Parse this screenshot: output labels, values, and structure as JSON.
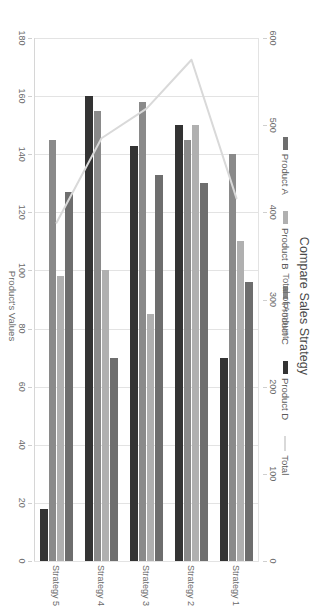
{
  "chart_data": {
    "type": "bar",
    "title": "Compare Sales Strategy",
    "categories": [
      "Strategy 1",
      "Strategy 2",
      "Strategy 3",
      "Strategy 4",
      "Strategy 5"
    ],
    "series": [
      {
        "name": "Product A",
        "values": [
          96,
          130,
          133,
          70,
          127
        ],
        "color": "#6e6e6e",
        "axis": "primary"
      },
      {
        "name": "Product B",
        "values": [
          110,
          150,
          85,
          100,
          98
        ],
        "color": "#b0b0b0",
        "axis": "primary"
      },
      {
        "name": "Product C",
        "values": [
          140,
          145,
          158,
          155,
          145
        ],
        "color": "#8a8a8a",
        "axis": "primary"
      },
      {
        "name": "Product D",
        "values": [
          70,
          150,
          143,
          160,
          18
        ],
        "color": "#333333",
        "axis": "primary"
      }
    ],
    "line_series": {
      "name": "Total",
      "values": [
        416,
        575,
        519,
        485,
        388
      ],
      "color": "#d9d9d9",
      "axis": "secondary"
    },
    "primary_axis": {
      "label": "Product's Values",
      "ticks": [
        0,
        20,
        40,
        60,
        80,
        100,
        120,
        140,
        160,
        180
      ],
      "min": 0,
      "max": 180,
      "position": "bottom"
    },
    "secondary_axis": {
      "label": "Total of Amount",
      "ticks": [
        0,
        100,
        200,
        300,
        400,
        500,
        600
      ],
      "min": 0,
      "max": 600,
      "position": "top"
    },
    "legend": {
      "position": "top",
      "entries": [
        {
          "label": "Product A",
          "color": "#6e6e6e",
          "marker": "bar"
        },
        {
          "label": "Product B",
          "color": "#b0b0b0",
          "marker": "bar"
        },
        {
          "label": "Product C",
          "color": "#8a8a8a",
          "marker": "bar"
        },
        {
          "label": "Product D",
          "color": "#333333",
          "marker": "bar"
        },
        {
          "label": "Total",
          "color": "#d9d9d9",
          "marker": "line"
        }
      ]
    },
    "grid": true,
    "orientation": "horizontal-bars",
    "rotation_degrees": 90
  }
}
